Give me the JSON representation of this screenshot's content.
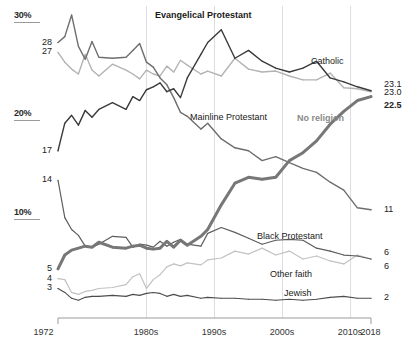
{
  "chart_data": {
    "type": "line",
    "title": "",
    "xlabel": "",
    "ylabel": "",
    "xlim": [
      1972,
      2018
    ],
    "ylim": [
      0,
      31
    ],
    "grid": "vertical-decade-gridlines",
    "legend": "inline-series-labels",
    "y_ticks": [
      "10%",
      "20%",
      "30%"
    ],
    "y_tick_values": [
      10,
      20,
      30
    ],
    "x_ticks": [
      "1972",
      "1980s",
      "1990s",
      "2000s",
      "2010s",
      "2018"
    ],
    "x_tick_values": [
      1972,
      1985,
      1995,
      2005,
      2015,
      2018
    ],
    "start_labels": [
      "28",
      "27",
      "17",
      "14",
      "5",
      "4",
      "3"
    ],
    "end_labels": [
      "23.1",
      "23.0",
      "22.5",
      "11",
      "6",
      "6",
      "2"
    ],
    "series": [
      {
        "name": "Evangelical Protestant",
        "color": "#3a3a3a",
        "width": 1.4,
        "label_style": "strong",
        "start_value": 17,
        "end_value": 23.1,
        "x": [
          1972,
          1973,
          1974,
          1975,
          1976,
          1977,
          1978,
          1980,
          1982,
          1983,
          1984,
          1985,
          1986,
          1987,
          1988,
          1989,
          1990,
          1991,
          1993,
          1994,
          1996,
          1998,
          2000,
          2002,
          2004,
          2006,
          2008,
          2010,
          2012,
          2014,
          2016,
          2018
        ],
        "values": [
          17,
          19.8,
          20.6,
          19.6,
          21.1,
          20.4,
          21.2,
          21.9,
          21.2,
          22.5,
          22.1,
          23.2,
          23.5,
          23.9,
          23.0,
          23.3,
          22.4,
          24.4,
          26.8,
          28.0,
          29.3,
          26.4,
          27.2,
          26.1,
          25.4,
          25.0,
          25.4,
          26.1,
          24.4,
          24.0,
          23.5,
          23.1
        ]
      },
      {
        "name": "Catholic",
        "color": "#b3b3b3",
        "width": 1.4,
        "label_style": "plain",
        "start_value": 27,
        "end_value": 23.0,
        "x": [
          1972,
          1973,
          1974,
          1975,
          1976,
          1977,
          1978,
          1980,
          1982,
          1983,
          1984,
          1985,
          1986,
          1987,
          1988,
          1989,
          1990,
          1991,
          1993,
          1994,
          1996,
          1998,
          2000,
          2002,
          2004,
          2006,
          2008,
          2010,
          2012,
          2014,
          2016,
          2018
        ],
        "values": [
          27,
          26.0,
          25.3,
          24.8,
          26.8,
          25.2,
          24.6,
          25.8,
          25.2,
          24.8,
          24.3,
          25.2,
          24.8,
          24.6,
          25.6,
          25.0,
          26.2,
          25.7,
          24.8,
          25.1,
          24.6,
          26.4,
          25.3,
          25.0,
          25.1,
          24.6,
          24.2,
          24.2,
          24.9,
          23.4,
          23.3,
          23.0
        ]
      },
      {
        "name": "Mainline Protestant",
        "color": "#6e6e6e",
        "width": 1.4,
        "label_style": "plain",
        "start_value": 28,
        "end_value": 11,
        "x": [
          1972,
          1973,
          1974,
          1975,
          1976,
          1977,
          1978,
          1980,
          1982,
          1983,
          1984,
          1985,
          1986,
          1987,
          1988,
          1989,
          1990,
          1991,
          1993,
          1994,
          1996,
          1998,
          2000,
          2002,
          2004,
          2006,
          2008,
          2010,
          2012,
          2014,
          2016,
          2018
        ],
        "values": [
          28,
          28.6,
          30.8,
          27.6,
          26.3,
          28.1,
          26.5,
          26.4,
          26.5,
          27.2,
          27.9,
          26.0,
          25.5,
          24.4,
          23.7,
          22.4,
          20.9,
          20.5,
          19.2,
          19.8,
          18.2,
          17.3,
          17.0,
          16.0,
          16.4,
          15.8,
          15.2,
          14.8,
          13.8,
          13.0,
          11.2,
          11
        ]
      },
      {
        "name": "No religion",
        "color": "#777777",
        "width": 3.0,
        "label_style": "muted",
        "start_value": 5,
        "end_value": 22.5,
        "x": [
          1972,
          1973,
          1974,
          1975,
          1976,
          1977,
          1978,
          1980,
          1982,
          1983,
          1984,
          1985,
          1986,
          1987,
          1988,
          1989,
          1990,
          1991,
          1993,
          1994,
          1996,
          1998,
          2000,
          2002,
          2004,
          2006,
          2008,
          2010,
          2012,
          2014,
          2016,
          2018
        ],
        "values": [
          5,
          6.4,
          6.9,
          7.1,
          7.3,
          7.2,
          7.7,
          7.2,
          7.1,
          7.3,
          7.4,
          7.1,
          7.0,
          7.1,
          7.8,
          7.2,
          7.9,
          7.4,
          8.3,
          9.0,
          11.5,
          13.7,
          14.3,
          14.1,
          14.3,
          16.0,
          16.8,
          18.0,
          19.7,
          21.0,
          22.1,
          22.5
        ]
      },
      {
        "name": "Black Protestant",
        "color": "#5d5d5d",
        "width": 1.2,
        "label_style": "plain",
        "start_value": 14,
        "end_value": 6,
        "x": [
          1972,
          1973,
          1974,
          1975,
          1976,
          1977,
          1978,
          1980,
          1982,
          1983,
          1984,
          1985,
          1986,
          1987,
          1988,
          1989,
          1990,
          1991,
          1993,
          1994,
          1996,
          1998,
          2000,
          2002,
          2004,
          2006,
          2008,
          2010,
          2012,
          2014,
          2016,
          2018
        ],
        "values": [
          14,
          10.2,
          9.0,
          8.4,
          7.3,
          7.2,
          7.5,
          8.3,
          8.2,
          7.2,
          7.5,
          7.4,
          7.2,
          7.8,
          7.3,
          7.7,
          8.0,
          7.5,
          7.3,
          8.6,
          9.2,
          8.7,
          8.1,
          7.5,
          7.9,
          8.0,
          7.9,
          7.1,
          6.8,
          6.4,
          6.3,
          6
        ]
      },
      {
        "name": "Other faith",
        "color": "#c2c2c2",
        "width": 1.2,
        "label_style": "plain",
        "start_value": 4,
        "end_value": 6,
        "x": [
          1972,
          1973,
          1974,
          1975,
          1976,
          1977,
          1978,
          1980,
          1982,
          1983,
          1984,
          1985,
          1986,
          1987,
          1988,
          1989,
          1990,
          1991,
          1993,
          1994,
          1996,
          1998,
          2000,
          2002,
          2004,
          2006,
          2008,
          2010,
          2012,
          2014,
          2016,
          2018
        ],
        "values": [
          4,
          3.9,
          2.6,
          2.4,
          2.7,
          2.8,
          3.0,
          3.1,
          3.4,
          4.2,
          4.5,
          3.0,
          3.9,
          4.4,
          5.2,
          5.5,
          5.3,
          5.6,
          5.4,
          5.9,
          6.1,
          6.8,
          6.5,
          7.1,
          6.4,
          6.8,
          6.0,
          6.3,
          5.8,
          5.5,
          6.4,
          6
        ]
      },
      {
        "name": "Jewish",
        "color": "#4d4d4d",
        "width": 1.1,
        "label_style": "plain",
        "start_value": 3,
        "end_value": 2,
        "x": [
          1972,
          1973,
          1974,
          1975,
          1976,
          1977,
          1978,
          1980,
          1982,
          1983,
          1984,
          1985,
          1986,
          1987,
          1988,
          1989,
          1990,
          1991,
          1993,
          1994,
          1996,
          1998,
          2000,
          2002,
          2004,
          2006,
          2008,
          2010,
          2012,
          2014,
          2016,
          2018
        ],
        "values": [
          3,
          2.6,
          2.0,
          1.8,
          2.1,
          2.2,
          2.2,
          2.3,
          2.2,
          2.4,
          2.3,
          2.5,
          2.6,
          2.5,
          2.2,
          2.4,
          2.2,
          2.3,
          2.0,
          2.1,
          2.0,
          2.0,
          1.9,
          1.9,
          1.8,
          1.9,
          1.8,
          1.9,
          2.1,
          2.2,
          2.0,
          2
        ]
      }
    ]
  },
  "axis": {
    "y_ticks": [
      {
        "label": "30%",
        "value": 30
      },
      {
        "label": "20%",
        "value": 20
      },
      {
        "label": "10%",
        "value": 10
      }
    ],
    "x_ticks": [
      {
        "label": "1972",
        "value": 1972
      },
      {
        "label": "1980s",
        "value": 1985
      },
      {
        "label": "1990s",
        "value": 1995
      },
      {
        "label": "2000s",
        "value": 2005
      },
      {
        "label": "2010s",
        "value": 2015
      },
      {
        "label": "2018",
        "value": 2018
      }
    ]
  },
  "start_labels": [
    {
      "text": "28",
      "value": 28
    },
    {
      "text": "27",
      "value": 27
    },
    {
      "text": "17",
      "value": 17
    },
    {
      "text": "14",
      "value": 14
    },
    {
      "text": "5",
      "value": 5
    },
    {
      "text": "4",
      "value": 4
    },
    {
      "text": "3",
      "value": 3
    }
  ],
  "end_labels": [
    {
      "text": "23.1",
      "value": 23.1,
      "bold": false
    },
    {
      "text": "23.0",
      "value": 23.0,
      "bold": false
    },
    {
      "text": "22.5",
      "value": 22.5,
      "bold": true
    },
    {
      "text": "11",
      "value": 11,
      "bold": false
    },
    {
      "text": "6",
      "value": 6,
      "bold": false
    },
    {
      "text": "6",
      "value": 6,
      "bold": false
    },
    {
      "text": "2",
      "value": 2,
      "bold": false
    }
  ],
  "series_labels": [
    {
      "text": "Evangelical Protestant",
      "style": "strong"
    },
    {
      "text": "Catholic",
      "style": "plain"
    },
    {
      "text": "Mainline Protestant",
      "style": "plain"
    },
    {
      "text": "No religion",
      "style": "muted"
    },
    {
      "text": "Black Protestant",
      "style": "plain"
    },
    {
      "text": "Other faith",
      "style": "plain"
    },
    {
      "text": "Jewish",
      "style": "plain"
    }
  ],
  "colors": {
    "evangelical": "#3a3a3a",
    "catholic": "#b3b3b3",
    "mainline": "#6e6e6e",
    "no_religion": "#777777",
    "black_protestant": "#5d5d5d",
    "other_faith": "#c2c2c2",
    "jewish": "#4d4d4d",
    "gridline": "#dcdce4",
    "axis": "#9a9a9a",
    "background": "#ffffff"
  }
}
